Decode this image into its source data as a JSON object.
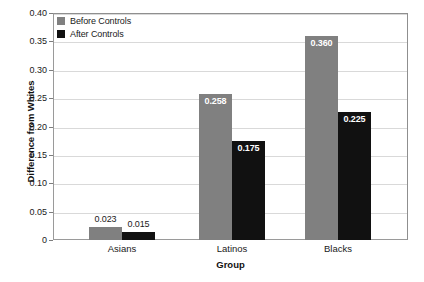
{
  "chart_data": {
    "type": "bar",
    "title": "",
    "xlabel": "Group",
    "ylabel": "Difference from Whites",
    "categories": [
      "Asians",
      "Latinos",
      "Blacks"
    ],
    "series": [
      {
        "name": "Before Controls",
        "color": "#808080",
        "values": [
          0.023,
          0.258,
          0.36
        ],
        "labels": [
          "0.023",
          "0.258",
          "0.360"
        ]
      },
      {
        "name": "After Controls",
        "color": "#111111",
        "values": [
          0.015,
          0.175,
          0.225
        ],
        "labels": [
          "0.015",
          "0.175",
          "0.225"
        ]
      }
    ],
    "ylim": [
      0,
      0.4
    ],
    "yticks": [
      0,
      0.05,
      0.1,
      0.15,
      0.2,
      0.25,
      0.3,
      0.35,
      0.4
    ],
    "ytick_labels": [
      "0",
      "0.05",
      "0.10",
      "0.15",
      "0.20",
      "0.25",
      "0.30",
      "0.35",
      "0.40"
    ],
    "grid": true,
    "legend_position": "top-left"
  },
  "axis": {
    "y_title": "Difference from Whites",
    "x_title": "Group"
  },
  "legend": {
    "items": [
      {
        "label": "Before Controls",
        "color": "#808080"
      },
      {
        "label": "After Controls",
        "color": "#111111"
      }
    ]
  }
}
